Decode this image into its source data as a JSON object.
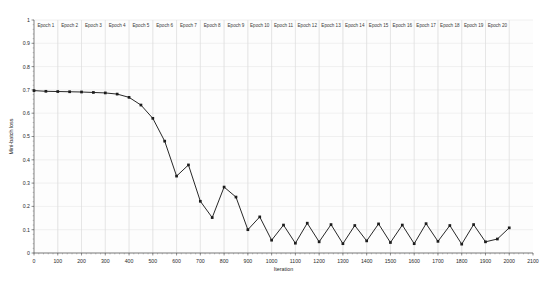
{
  "chart_data": {
    "type": "line",
    "title": "",
    "xlabel": "Iteration",
    "ylabel": "Mini-batch loss",
    "xlim": [
      0,
      2100
    ],
    "ylim": [
      0,
      1
    ],
    "xticks": [
      0,
      100,
      200,
      300,
      400,
      500,
      600,
      700,
      800,
      900,
      1000,
      1100,
      1200,
      1300,
      1400,
      1500,
      1600,
      1700,
      1800,
      1900,
      2000,
      2100
    ],
    "yticks": [
      0,
      0.1,
      0.2,
      0.3,
      0.4,
      0.5,
      0.6,
      0.7,
      0.8,
      0.9,
      1
    ],
    "xtick_labels": [
      "0",
      "100",
      "200",
      "300",
      "400",
      "500",
      "600",
      "700",
      "800",
      "900",
      "1000",
      "1100",
      "1200",
      "1300",
      "1400",
      "1500",
      "1600",
      "1700",
      "1800",
      "1900",
      "2000",
      "2100"
    ],
    "ytick_labels": [
      "0",
      "0.1",
      "0.2",
      "0.3",
      "0.4",
      "0.5",
      "0.6",
      "0.7",
      "0.8",
      "0.9",
      "1"
    ],
    "grid": true,
    "legend": null,
    "marker": "square",
    "line_color": "#1c1c1c",
    "epoch_boundaries": [
      100,
      200,
      300,
      400,
      500,
      600,
      700,
      800,
      900,
      1000,
      1100,
      1200,
      1300,
      1400,
      1500,
      1600,
      1700,
      1800,
      1900,
      2000
    ],
    "epoch_labels": [
      "Epoch 1",
      "Epoch 2",
      "Epoch 3",
      "Epoch 4",
      "Epoch 5",
      "Epoch 6",
      "Epoch 7",
      "Epoch 8",
      "Epoch 9",
      "Epoch 10",
      "Epoch 11",
      "Epoch 12",
      "Epoch 13",
      "Epoch 14",
      "Epoch 15",
      "Epoch 16",
      "Epoch 17",
      "Epoch 18",
      "Epoch 19",
      "Epoch 20"
    ],
    "x": [
      0,
      50,
      100,
      150,
      200,
      250,
      300,
      350,
      400,
      450,
      500,
      550,
      600,
      650,
      700,
      750,
      800,
      850,
      900,
      950,
      1000,
      1050,
      1100,
      1150,
      1200,
      1250,
      1300,
      1350,
      1400,
      1450,
      1500,
      1550,
      1600,
      1650,
      1700,
      1750,
      1800,
      1850,
      1900,
      1950,
      2000
    ],
    "values": [
      0.697,
      0.694,
      0.693,
      0.692,
      0.691,
      0.689,
      0.687,
      0.682,
      0.668,
      0.635,
      0.578,
      0.48,
      0.33,
      0.378,
      0.222,
      0.152,
      0.283,
      0.24,
      0.1,
      0.155,
      0.055,
      0.12,
      0.042,
      0.128,
      0.048,
      0.122,
      0.04,
      0.118,
      0.052,
      0.125,
      0.045,
      0.12,
      0.04,
      0.126,
      0.05,
      0.118,
      0.038,
      0.122,
      0.048,
      0.06,
      0.108
    ]
  }
}
